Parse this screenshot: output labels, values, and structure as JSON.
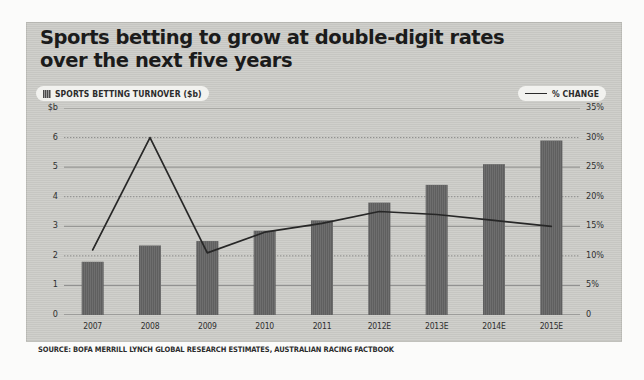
{
  "figure": {
    "title_lines": [
      "Sports betting to grow at double-digit rates",
      "over the next five years"
    ],
    "source": "SOURCE: BOFA MERRILL LYNCH GLOBAL RESEARCH ESTIMATES, AUSTRALIAN RACING FACTBOOK",
    "panel_color": "#cdcdc9",
    "bar_color": "#5f5f5f",
    "line_color": "#272727",
    "text_color": "#1b1b1b"
  },
  "legend": {
    "bar_series_label": "SPORTS BETTING TURNOVER ($b)",
    "line_series_label": "% CHANGE"
  },
  "axes": {
    "left_unit": "$b",
    "left_ticks": [
      "$b",
      "6",
      "5",
      "4",
      "3",
      "2",
      "1",
      "0"
    ],
    "right_ticks": [
      "35%",
      "30%",
      "25%",
      "20%",
      "15%",
      "10%",
      "5%",
      "0"
    ],
    "left_min": 0,
    "left_max": 7,
    "right_min": 0,
    "right_max": 35
  },
  "chart_data": {
    "type": "bar",
    "title": "Sports betting to grow at double-digit rates over the next five years",
    "subtitle": "",
    "xlabel": "",
    "ylabel": "$b",
    "y2label": "% change",
    "ylim": [
      0,
      7
    ],
    "y2lim": [
      0,
      35
    ],
    "grid": true,
    "legend_position": "top",
    "categories": [
      "2007",
      "2008",
      "2009",
      "2010",
      "2011",
      "2012E",
      "2013E",
      "2014E",
      "2015E"
    ],
    "series": [
      {
        "name": "SPORTS BETTING TURNOVER ($b)",
        "type": "bar",
        "axis": "left",
        "color": "#5f5f5f",
        "values": [
          1.8,
          2.35,
          2.5,
          2.85,
          3.2,
          3.8,
          4.4,
          5.1,
          5.9
        ]
      },
      {
        "name": "% CHANGE",
        "type": "line",
        "axis": "right",
        "color": "#272727",
        "values": [
          11.0,
          30.0,
          10.5,
          14.0,
          15.5,
          17.5,
          17.0,
          16.0,
          15.0
        ]
      }
    ]
  }
}
